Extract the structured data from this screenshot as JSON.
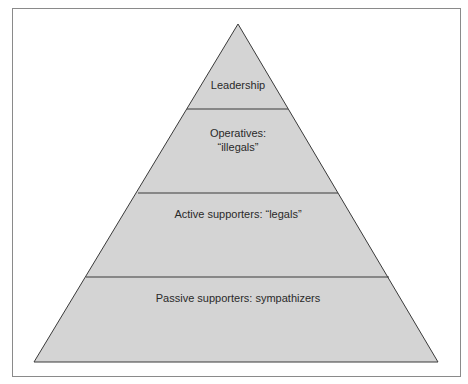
{
  "diagram": {
    "type": "pyramid",
    "colors": {
      "fill": "#d4d4d4",
      "stroke": "#3a3a3a",
      "frame": "#8a8a8a",
      "background": "#ffffff"
    },
    "tiers": [
      {
        "lines": [
          "Leadership"
        ]
      },
      {
        "lines": [
          "Operatives:",
          "“illegals”"
        ]
      },
      {
        "lines": [
          "Active supporters: “legals”"
        ]
      },
      {
        "lines": [
          "Passive supporters: sympathizers"
        ]
      }
    ]
  }
}
